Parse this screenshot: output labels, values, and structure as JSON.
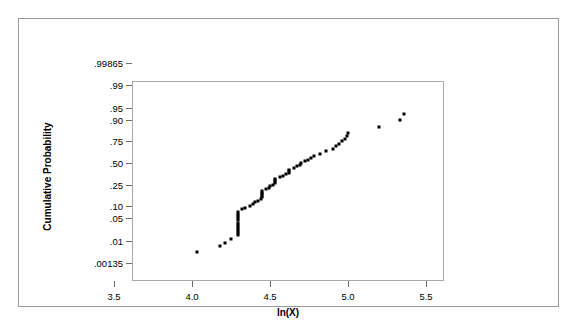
{
  "chart_data": {
    "type": "scatter",
    "title": "",
    "subtitle": "",
    "xlabel": "ln(X)",
    "ylabel": "Cumulative Probability",
    "grid": false,
    "legend": null,
    "legend_position": "none",
    "yscale": "normal-probability",
    "xlim": [
      3.5,
      5.5
    ],
    "xticks": [
      3.5,
      4.0,
      4.5,
      5.0,
      5.5
    ],
    "xticklabels": [
      "3.5",
      "4.0",
      "4.5",
      "5.0",
      "5.5"
    ],
    "yticks": [
      0.00135,
      0.01,
      0.05,
      0.1,
      0.25,
      0.5,
      0.75,
      0.9,
      0.95,
      0.99,
      0.99865
    ],
    "yticklabels": [
      ".00135",
      ".01",
      ".05",
      ".10",
      ".25",
      ".50",
      ".75",
      ".90",
      ".95",
      ".99",
      ".99865"
    ],
    "ylim": [
      0.00135,
      0.99865
    ],
    "marker": "square",
    "marker_color": "#000000",
    "marker_size": 3,
    "points": [
      {
        "x": 3.91,
        "y": 0.018
      },
      {
        "x": 4.06,
        "y": 0.028
      },
      {
        "x": 4.09,
        "y": 0.034
      },
      {
        "x": 4.13,
        "y": 0.043
      },
      {
        "x": 4.17,
        "y": 0.055
      },
      {
        "x": 4.17,
        "y": 0.062
      },
      {
        "x": 4.17,
        "y": 0.07
      },
      {
        "x": 4.17,
        "y": 0.079
      },
      {
        "x": 4.17,
        "y": 0.089
      },
      {
        "x": 4.17,
        "y": 0.1
      },
      {
        "x": 4.17,
        "y": 0.112
      },
      {
        "x": 4.17,
        "y": 0.125
      },
      {
        "x": 4.17,
        "y": 0.139
      },
      {
        "x": 4.17,
        "y": 0.154
      },
      {
        "x": 4.17,
        "y": 0.17
      },
      {
        "x": 4.17,
        "y": 0.187
      },
      {
        "x": 4.2,
        "y": 0.205
      },
      {
        "x": 4.22,
        "y": 0.222
      },
      {
        "x": 4.25,
        "y": 0.24
      },
      {
        "x": 4.27,
        "y": 0.258
      },
      {
        "x": 4.28,
        "y": 0.272
      },
      {
        "x": 4.3,
        "y": 0.288
      },
      {
        "x": 4.32,
        "y": 0.305
      },
      {
        "x": 4.33,
        "y": 0.322
      },
      {
        "x": 4.33,
        "y": 0.34
      },
      {
        "x": 4.33,
        "y": 0.358
      },
      {
        "x": 4.33,
        "y": 0.376
      },
      {
        "x": 4.33,
        "y": 0.394
      },
      {
        "x": 4.35,
        "y": 0.412
      },
      {
        "x": 4.37,
        "y": 0.43
      },
      {
        "x": 4.38,
        "y": 0.448
      },
      {
        "x": 4.4,
        "y": 0.466
      },
      {
        "x": 4.41,
        "y": 0.484
      },
      {
        "x": 4.41,
        "y": 0.502
      },
      {
        "x": 4.41,
        "y": 0.52
      },
      {
        "x": 4.41,
        "y": 0.538
      },
      {
        "x": 4.44,
        "y": 0.556
      },
      {
        "x": 4.46,
        "y": 0.574
      },
      {
        "x": 4.48,
        "y": 0.592
      },
      {
        "x": 4.5,
        "y": 0.61
      },
      {
        "x": 4.5,
        "y": 0.628
      },
      {
        "x": 4.5,
        "y": 0.646
      },
      {
        "x": 4.53,
        "y": 0.664
      },
      {
        "x": 4.55,
        "y": 0.682
      },
      {
        "x": 4.57,
        "y": 0.7
      },
      {
        "x": 4.58,
        "y": 0.716
      },
      {
        "x": 4.6,
        "y": 0.732
      },
      {
        "x": 4.62,
        "y": 0.748
      },
      {
        "x": 4.64,
        "y": 0.764
      },
      {
        "x": 4.66,
        "y": 0.78
      },
      {
        "x": 4.7,
        "y": 0.8
      },
      {
        "x": 4.74,
        "y": 0.82
      },
      {
        "x": 4.78,
        "y": 0.842
      },
      {
        "x": 4.8,
        "y": 0.858
      },
      {
        "x": 4.82,
        "y": 0.872
      },
      {
        "x": 4.84,
        "y": 0.888
      },
      {
        "x": 4.86,
        "y": 0.902
      },
      {
        "x": 4.87,
        "y": 0.916
      },
      {
        "x": 4.88,
        "y": 0.928
      },
      {
        "x": 5.08,
        "y": 0.95
      },
      {
        "x": 5.21,
        "y": 0.968
      },
      {
        "x": 5.24,
        "y": 0.98
      }
    ]
  }
}
